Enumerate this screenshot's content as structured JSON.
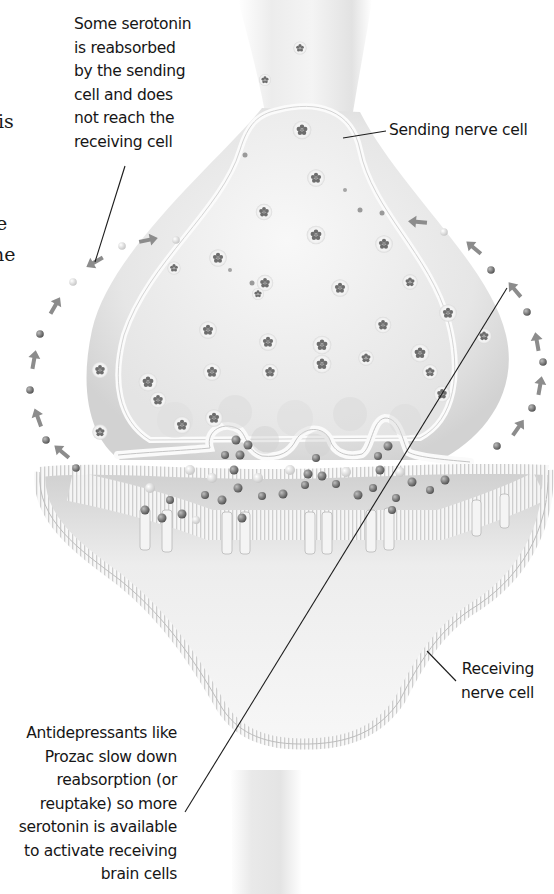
{
  "figure": {
    "type": "synapse-illustration",
    "palette": {
      "background": "#ffffff",
      "text": "#161616",
      "cell_fill": "#e9e9e9",
      "cell_shade": "#c9c9c9",
      "membrane": "#f7f7f7",
      "vesicle": "#7d7d7d",
      "molecule": "#6a6a6a",
      "arrow": "#8c8c8c",
      "leader_line": "#1c1c1c"
    }
  },
  "left_edge_fragments": [
    "is",
    "e",
    "ne"
  ],
  "labels": {
    "reuptake_note": {
      "lines": [
        "Some serotonin",
        "is reabsorbed",
        "by the sending",
        "cell and does",
        "not reach the",
        "receiving cell"
      ]
    },
    "sending_cell": {
      "lines": [
        "Sending nerve cell"
      ]
    },
    "receiving_cell": {
      "lines": [
        "Receiving",
        "nerve cell"
      ]
    },
    "antidepressant_note": {
      "lines": [
        "Antidepressants like",
        "Prozac slow down",
        "reabsorption (or",
        "reuptake) so more",
        "serotonin is available",
        "to activate receiving",
        "brain cells"
      ]
    }
  }
}
